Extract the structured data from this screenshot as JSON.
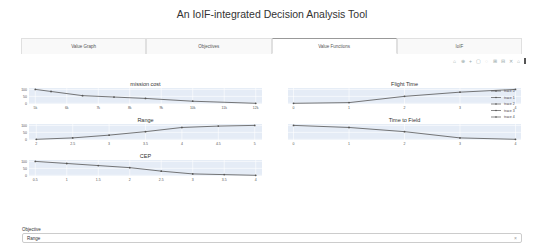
{
  "app": {
    "title": "An IoIF-integrated Decision Analysis Tool"
  },
  "tabs": [
    {
      "label": "Value Graph",
      "active": false
    },
    {
      "label": "Objectives",
      "active": false
    },
    {
      "label": "Value Functions",
      "active": true
    },
    {
      "label": "IoIF",
      "active": false
    }
  ],
  "modebar": {
    "icons": [
      "camera-icon",
      "zoom-icon",
      "pan-icon",
      "box-select-icon",
      "lasso-select-icon",
      "zoom-in-icon",
      "zoom-out-icon",
      "autoscale-icon",
      "reset-axes-icon",
      "plotly-logo"
    ],
    "glyphs": [
      "⌂",
      "⊕",
      "+",
      "▢",
      "◌",
      "⊞",
      "⊟",
      "✕",
      "⌂",
      ""
    ]
  },
  "legend": {
    "entries": [
      "trace 0",
      "trace 1",
      "trace 2",
      "trace 3",
      "trace 4"
    ]
  },
  "objective": {
    "label": "Objective",
    "value": "Range",
    "clear_glyph": "×"
  },
  "colors": {
    "plot_bg": "#e5ecf6",
    "trace": "#555555",
    "active_tab_border": "#999999"
  },
  "chart_data": [
    {
      "type": "line",
      "title": "mission cost",
      "x": [
        5000,
        5500,
        6500,
        7500,
        8500,
        10000,
        12000
      ],
      "y": [
        100,
        85,
        55,
        45,
        35,
        15,
        0
      ],
      "xticks": [
        "5k",
        "6k",
        "7k",
        "8k",
        "9k",
        "10k",
        "11k",
        "12k"
      ],
      "xtick_values": [
        5000,
        6000,
        7000,
        8000,
        9000,
        10000,
        11000,
        12000
      ],
      "yticks": [
        "0",
        "50",
        "100"
      ],
      "xlim": [
        4800,
        12200
      ],
      "ylim": [
        -5,
        110
      ],
      "legend": "trace 0",
      "grid": true
    },
    {
      "type": "line",
      "title": "Flight Time",
      "x": [
        0,
        1,
        2,
        3,
        4
      ],
      "y": [
        0,
        5,
        50,
        80,
        100
      ],
      "xticks": [
        "0",
        "1",
        "2",
        "3",
        "4"
      ],
      "xtick_values": [
        0,
        1,
        2,
        3,
        4
      ],
      "yticks": [],
      "xlim": [
        -0.1,
        4.1
      ],
      "ylim": [
        -5,
        110
      ],
      "legend": "trace 1",
      "grid": true
    },
    {
      "type": "line",
      "title": "Range",
      "x": [
        2,
        2.5,
        3,
        3.5,
        4,
        4.5,
        5
      ],
      "y": [
        0,
        10,
        30,
        55,
        85,
        95,
        100
      ],
      "xticks": [
        "2",
        "2.5",
        "3",
        "3.5",
        "4",
        "4.5",
        "5"
      ],
      "xtick_values": [
        2,
        2.5,
        3,
        3.5,
        4,
        4.5,
        5
      ],
      "yticks": [
        "0",
        "50",
        "100"
      ],
      "xlim": [
        1.9,
        5.1
      ],
      "ylim": [
        -5,
        110
      ],
      "legend": "trace 2",
      "grid": true
    },
    {
      "type": "line",
      "title": "Time to Field",
      "x": [
        0,
        1,
        2,
        3,
        4
      ],
      "y": [
        100,
        85,
        55,
        10,
        0
      ],
      "xticks": [
        "0",
        "1",
        "2",
        "3",
        "4"
      ],
      "xtick_values": [
        0,
        1,
        2,
        3,
        4
      ],
      "yticks": [],
      "xlim": [
        -0.1,
        4.1
      ],
      "ylim": [
        -5,
        110
      ],
      "legend": "trace 3",
      "grid": true
    },
    {
      "type": "line",
      "title": "CEP",
      "x": [
        0.5,
        1,
        1.5,
        2,
        2.5,
        3,
        3.5,
        4
      ],
      "y": [
        100,
        85,
        70,
        55,
        30,
        10,
        5,
        0
      ],
      "xticks": [
        "0.5",
        "1",
        "1.5",
        "2",
        "2.5",
        "3",
        "3.5",
        "4"
      ],
      "xtick_values": [
        0.5,
        1,
        1.5,
        2,
        2.5,
        3,
        3.5,
        4
      ],
      "yticks": [
        "0",
        "50",
        "100"
      ],
      "xlim": [
        0.4,
        4.1
      ],
      "ylim": [
        -5,
        110
      ],
      "legend": "trace 4",
      "grid": true
    }
  ]
}
